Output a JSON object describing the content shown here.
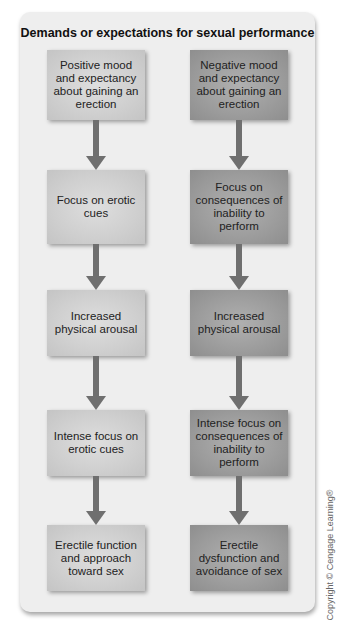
{
  "title": "Demands or expectations for sexual performance",
  "left_column": [
    "Positive mood and expectancy about gaining an erection",
    "Focus on erotic cues",
    "Increased physical arousal",
    "Intense focus on erotic cues",
    "Erectile function and approach toward sex"
  ],
  "right_column": [
    "Negative mood and expectancy about gaining an erection",
    "Focus on consequences of inability to perform",
    "Increased physical arousal",
    "Intense focus on consequences of inability to perform",
    "Erectile dysfunction and avoidance of sex"
  ],
  "copyright": "Copyright © Cengage Learning®",
  "colors": {
    "panel": "#eeeeee",
    "left_box": "#d2d2d2",
    "right_box": "#9e9e9e",
    "arrow": "#6f6f6f"
  }
}
